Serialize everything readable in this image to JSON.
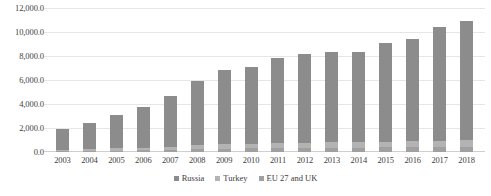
{
  "chart_data": {
    "type": "bar",
    "stacked": true,
    "title": "",
    "xlabel": "",
    "ylabel": "",
    "ylim": [
      0,
      12000
    ],
    "ytick_step": 2000,
    "grid": true,
    "legend_position": "bottom",
    "categories": [
      "2003",
      "2004",
      "2005",
      "2006",
      "2007",
      "2008",
      "2009",
      "2010",
      "2011",
      "2012",
      "2013",
      "2014",
      "2015",
      "2016",
      "2017",
      "2018"
    ],
    "ytick_labels": [
      "12,000.0",
      "10,000.0",
      "8,000.0",
      "6,000.0",
      "4,000.0",
      "2,000.0",
      "0.0"
    ],
    "series": [
      {
        "name": "Russia",
        "color": "#8c8c8c",
        "values": [
          1700,
          2150,
          2800,
          3400,
          4200,
          5400,
          6200,
          6400,
          7100,
          7400,
          7500,
          7500,
          8200,
          8500,
          9500,
          9900
        ]
      },
      {
        "name": "Turkey",
        "color": "#b3b3b3",
        "values": [
          130,
          150,
          180,
          200,
          250,
          300,
          350,
          380,
          420,
          440,
          450,
          450,
          480,
          500,
          520,
          540
        ]
      },
      {
        "name": "EU 27 and UK",
        "color": "#a0a0a0",
        "values": [
          70,
          100,
          120,
          150,
          200,
          250,
          280,
          300,
          330,
          350,
          360,
          360,
          380,
          400,
          420,
          440
        ]
      }
    ],
    "totals": [
      1900,
      2400,
      3100,
      3750,
      4650,
      5950,
      6830,
      7080,
      7850,
      8190,
      8310,
      8310,
      9060,
      9400,
      10440,
      10880
    ]
  },
  "legend": {
    "items": [
      {
        "label": "Russia"
      },
      {
        "label": "Turkey"
      },
      {
        "label": "EU 27 and UK"
      }
    ]
  }
}
